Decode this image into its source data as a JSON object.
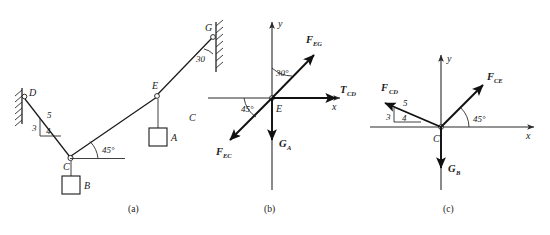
{
  "figure": {
    "panels": [
      {
        "id": "a",
        "caption": "(a)",
        "description": "Physical arrangement of cables and struts",
        "points": [
          {
            "name": "D",
            "label": "D"
          },
          {
            "name": "C",
            "label": "C"
          },
          {
            "name": "E",
            "label": "E"
          },
          {
            "name": "G",
            "label": "G"
          }
        ],
        "blocks": [
          {
            "name": "A",
            "label": "A"
          },
          {
            "name": "B",
            "label": "B"
          }
        ],
        "angles": [
          {
            "name": "angle-at-C",
            "label": "45°"
          },
          {
            "name": "angle-at-G",
            "label": "30"
          }
        ],
        "slope_triangle": {
          "vertical": "3",
          "horizontal": "4",
          "hypotenuse": "5"
        },
        "stray_label": "C"
      },
      {
        "id": "b",
        "caption": "(b)",
        "description": "Free-body diagram at joint E",
        "origin_label": "E",
        "axes": {
          "x": "x",
          "y": "y"
        },
        "vectors": [
          {
            "name": "F-EG",
            "base": "F",
            "sub": "EG"
          },
          {
            "name": "T-CD",
            "base": "T",
            "sub": "CD"
          },
          {
            "name": "F-EC",
            "base": "F",
            "sub": "EC"
          },
          {
            "name": "G-A",
            "base": "G",
            "sub": "A"
          }
        ],
        "angles": [
          {
            "name": "angle-FEG",
            "label": "30°"
          },
          {
            "name": "angle-FEC",
            "label": "45°"
          }
        ]
      },
      {
        "id": "c",
        "caption": "(c)",
        "description": "Free-body diagram at joint C",
        "origin_label": "C",
        "axes": {
          "x": "x",
          "y": "y"
        },
        "vectors": [
          {
            "name": "F-CD",
            "base": "F",
            "sub": "CD"
          },
          {
            "name": "F-CE",
            "base": "F",
            "sub": "CE"
          },
          {
            "name": "G-B",
            "base": "G",
            "sub": "B"
          }
        ],
        "angles": [
          {
            "name": "angle-FCE",
            "label": "45°"
          }
        ],
        "slope_triangle": {
          "vertical": "3",
          "horizontal": "4",
          "hypotenuse": "5"
        }
      }
    ]
  }
}
